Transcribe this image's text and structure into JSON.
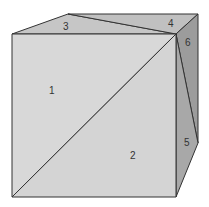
{
  "diagram": {
    "type": "cube-face-partition",
    "colors": {
      "front": "#d6d6d6",
      "top": "#c4c4c4",
      "side_light": "#a8a8a8",
      "side_dark": "#9a9a9a",
      "edge": "#333333"
    },
    "regions": [
      {
        "id": "1",
        "label": "1",
        "face": "front",
        "part": "upper-left triangle"
      },
      {
        "id": "2",
        "label": "2",
        "face": "front",
        "part": "lower-right triangle"
      },
      {
        "id": "3",
        "label": "3",
        "face": "top",
        "part": "front triangle"
      },
      {
        "id": "4",
        "label": "4",
        "face": "top",
        "part": "back triangle"
      },
      {
        "id": "5",
        "label": "5",
        "face": "right",
        "part": "lower triangle"
      },
      {
        "id": "6",
        "label": "6",
        "face": "right",
        "part": "upper triangle"
      }
    ]
  }
}
